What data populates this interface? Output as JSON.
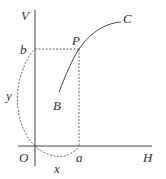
{
  "diagram": {
    "axis_labels": {
      "vertical": "V",
      "horizontal": "H",
      "origin": "O"
    },
    "point_labels": {
      "b": "b",
      "P": "P",
      "a": "a",
      "B": "B",
      "C": "C"
    },
    "arc_labels": {
      "y": "y",
      "x": "x"
    },
    "colors": {
      "line": "#444444",
      "text": "#333333"
    }
  }
}
